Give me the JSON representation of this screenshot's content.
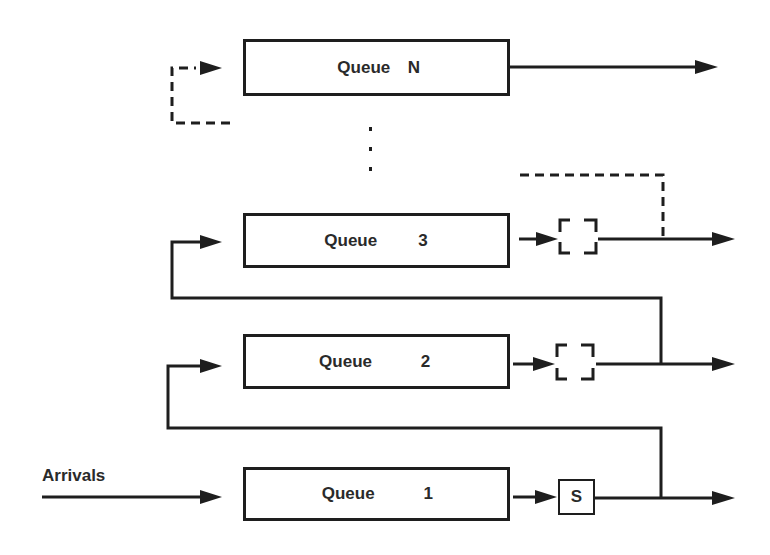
{
  "diagram": {
    "type": "multilevel-feedback-queue",
    "arrivals_label": "Arrivals",
    "ellipsis": "⋮",
    "queues": [
      {
        "name": "Queue",
        "index": "N",
        "server": "none",
        "feedback": "dashed"
      },
      {
        "name": "Queue",
        "index": "3",
        "server": "dashed-box",
        "feedback": "solid"
      },
      {
        "name": "Queue",
        "index": "2",
        "server": "dashed-box",
        "feedback": "solid"
      },
      {
        "name": "Queue",
        "index": "1",
        "server": "S",
        "feedback": "solid"
      }
    ],
    "server_label": "S",
    "colors": {
      "stroke": "#1e1e1e",
      "text": "#2a2a2a",
      "background": "#ffffff"
    }
  }
}
